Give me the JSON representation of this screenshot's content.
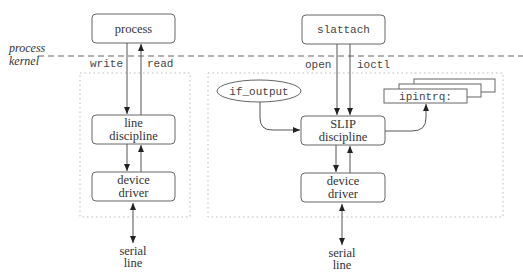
{
  "boundary": {
    "upper_label": "process",
    "lower_label": "kernel"
  },
  "left_stack": {
    "top_box": "process",
    "down_label": "write",
    "up_label": "read",
    "middle_box": [
      "line",
      "discipline"
    ],
    "bottom_box": [
      "device",
      "driver"
    ],
    "endpoint": [
      "serial",
      "line"
    ]
  },
  "right_stack": {
    "top_box": "slattach",
    "left_label": "open",
    "right_label": "ioctl",
    "input_ellipse": "if_output",
    "middle_box": [
      "SLIP",
      "discipline"
    ],
    "queue_box": "ipintrq:",
    "bottom_box": [
      "device",
      "driver"
    ],
    "endpoint": [
      "serial",
      "line"
    ]
  },
  "colors": {
    "stroke": "#666666",
    "dotted_frame": "#bbbbbb",
    "background": "#ffffff"
  }
}
